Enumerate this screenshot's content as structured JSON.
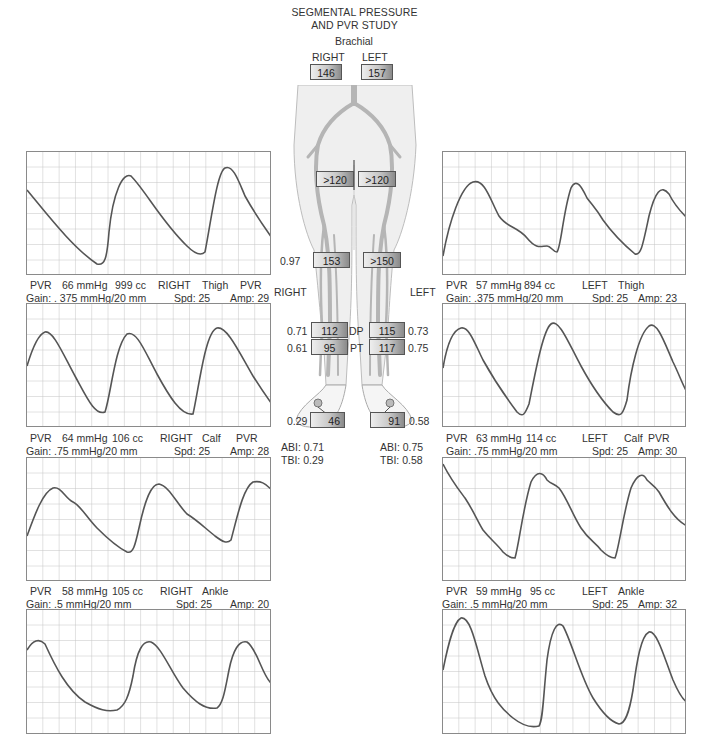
{
  "title": {
    "line1": "SEGMENTAL PRESSURE",
    "line2": "AND PVR STUDY"
  },
  "brachial": {
    "label": "Brachial",
    "right_label": "RIGHT",
    "left_label": "LEFT",
    "right_value": "146",
    "left_value": "157"
  },
  "side_labels": {
    "right": "RIGHT",
    "left": "LEFT"
  },
  "segments": {
    "high_thigh": {
      "right": ">120",
      "left": ">120"
    },
    "above_knee": {
      "right": "153",
      "left": ">150",
      "right_index": "0.97"
    },
    "dp": {
      "label": "DP",
      "right": "112",
      "left": "115",
      "right_index": "0.71",
      "left_index": "0.73"
    },
    "pt": {
      "label": "PT",
      "right": "95",
      "left": "117",
      "right_index": "0.61",
      "left_index": "0.75"
    },
    "toe": {
      "right": "46",
      "left": "91",
      "right_index": "0.29",
      "left_index": "0.58"
    }
  },
  "indices": {
    "right": {
      "abi": "ABI: 0.71",
      "tbi": "TBI: 0.29"
    },
    "left": {
      "abi": "ABI: 0.75",
      "tbi": "TBI: 0.58"
    }
  },
  "colors": {
    "grid": "#c4c4c4",
    "trace": "#555555",
    "border": "#8a8a8a",
    "vessel": "#b0b0b0",
    "skin": "#efefef"
  },
  "panels": {
    "right_thigh": {
      "pvr": "PVR",
      "mmhg": "66 mmHg",
      "cc": "999 cc",
      "side": "RIGHT",
      "site": "Thigh",
      "extra": "PVR",
      "gain": "Gain: . 375 mmHg/20 mm",
      "spd": "Spd: 25",
      "amp": "Amp: 29"
    },
    "left_thigh": {
      "pvr": "PVR",
      "mmhg": "57 mmHg",
      "cc": "894 cc",
      "side": "LEFT",
      "site": "Thigh",
      "extra": "",
      "gain": "Gain: .375 mmHg/20 mm",
      "spd": "Spd: 25",
      "amp": "Amp: 23"
    },
    "right_calf": {
      "pvr": "PVR",
      "mmhg": "64 mmHg",
      "cc": "106 cc",
      "side": "RIGHT",
      "site": "Calf",
      "extra": "PVR",
      "gain": "Gain: .75 mmHg/20 mm",
      "spd": "Spd: 25",
      "amp": "Amp: 28"
    },
    "left_calf": {
      "pvr": "PVR",
      "mmhg": "63 mmHg",
      "cc": "114 cc",
      "side": "LEFT",
      "site": "Calf",
      "extra": "PVR",
      "gain": "Gain: .75 mmHg/20 mm",
      "spd": "Spd: 25",
      "amp": "Amp: 30"
    },
    "right_ankle": {
      "pvr": "PVR",
      "mmhg": "58 mmHg",
      "cc": "105 cc",
      "side": "RIGHT",
      "site": "Ankle",
      "extra": "",
      "gain": "Gain: .5 mmHg/20 mm",
      "spd": "Spd: 25",
      "amp": "Amp: 20"
    },
    "left_ankle": {
      "pvr": "PVR",
      "mmhg": "59 mmHg",
      "cc": "95 cc",
      "side": "LEFT",
      "site": "Ankle",
      "extra": "",
      "gain": "Gain: .5 mmHg/20 mm",
      "spd": "Spd: 25",
      "amp": "Amp: 32"
    }
  },
  "waveforms": {
    "high_thigh_right": "M0,52 C20,78 45,102 62,110 C70,112 72,105 74,70 C78,30 88,18 96,22 C110,35 130,70 150,90 C160,100 170,103 176,100 C180,70 186,20 196,12 C204,6 210,20 216,34 C228,55 240,75 244,90",
    "high_thigh_left": "M0,108 C6,70 18,34 30,28 C42,24 48,50 56,64 C64,76 74,72 84,90 C94,104 100,96 110,104 C114,100 116,60 124,30 C130,18 136,30 140,46 C146,56 150,52 156,70 C168,88 176,98 190,104 C196,100 198,70 206,40 C214,24 220,34 226,50 C234,60 240,66 244,68",
    "right_calf": "M0,62 C8,40 14,28 18,26 C24,24 34,50 48,75 C60,96 68,110 76,106 C84,90 88,40 100,30 C108,26 116,48 128,70 C140,92 154,110 166,108 C174,80 180,30 192,26 C200,24 212,48 226,72 C236,88 244,98 244,100",
    "left_calf": "M0,66 C4,40 10,24 18,22 C24,20 30,40 38,56 C48,74 62,92 74,108 C82,116 84,112 88,100 C94,70 102,24 110,18 C118,14 128,40 140,62 C152,84 164,100 172,110 C180,116 184,112 186,100 C190,70 196,30 206,20 C214,16 222,40 230,58 C236,72 240,86 244,92",
    "right_calf_hp": "",
    "right_ankle": "M0,78 C8,56 16,38 24,36 C32,34 36,48 44,52 C54,58 60,70 70,80 C82,90 92,100 98,102 C104,102 106,92 110,80 C116,50 122,30 130,28 C140,28 150,48 160,58 C168,64 176,72 186,84 C196,92 200,96 204,92 C210,70 216,34 226,26 C236,24 240,30 244,36",
    "left_ankle": "M0,4 C10,20 18,36 24,46 C32,58 38,70 46,80 C52,88 56,90 60,96 C66,102 70,100 72,100 C76,80 80,40 90,18 C96,10 100,14 104,18 C112,20 116,30 122,44 C132,68 140,78 150,84 C158,92 162,96 168,98 C174,100 176,96 180,86 C184,60 188,28 196,18 C204,6 210,14 216,26 C224,38 232,52 244,64",
    "ankle_right": "M0,42 C6,32 12,30 18,36 C28,58 40,82 58,92 C72,100 80,100 88,100 C96,98 102,90 106,70 C110,40 116,30 124,32 C134,36 144,62 156,78 C168,92 178,98 190,98 C196,94 198,80 202,60 C206,40 212,32 220,34 C230,40 236,70 244,76",
    "ankle_left": "M0,60 C4,40 10,12 18,8 C28,6 34,40 42,66 C50,90 60,100 70,108 C80,116 88,118 96,116 C100,110 100,90 104,50 C108,20 114,10 120,16 C128,30 138,68 150,88 C160,104 168,112 176,114 C182,114 186,104 190,80 C194,50 198,26 206,22 C214,20 222,50 230,70 C236,84 240,90 244,92"
  }
}
